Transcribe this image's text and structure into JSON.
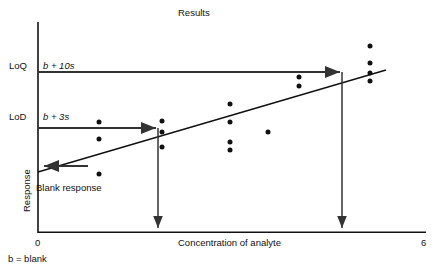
{
  "chart_data": {
    "type": "scatter",
    "title": "Results",
    "xlabel": "Concentration of analyte",
    "ylabel": "Response",
    "xlim": [
      0,
      6
    ],
    "xticklabels": [
      "0",
      "6"
    ],
    "grid": false,
    "legend": null,
    "footnote": "b = blank",
    "annotations": [
      {
        "name": "LoQ",
        "label": "LoQ",
        "formula": "b + 10s",
        "level_y": 72,
        "arrow_to_x": 342
      },
      {
        "name": "LoD",
        "label": "LoD",
        "formula": "b + 3s",
        "level_y": 128,
        "arrow_to_x": 158
      },
      {
        "name": "blank-response",
        "label": "Blank response"
      }
    ],
    "regression_line": {
      "x1": 38,
      "y1": 172,
      "x2": 385,
      "y2": 70
    },
    "points": [
      {
        "x": 99,
        "y": 122
      },
      {
        "x": 99,
        "y": 139
      },
      {
        "x": 99,
        "y": 174
      },
      {
        "x": 162,
        "y": 121
      },
      {
        "x": 162,
        "y": 132
      },
      {
        "x": 162,
        "y": 147
      },
      {
        "x": 230,
        "y": 104
      },
      {
        "x": 230,
        "y": 122
      },
      {
        "x": 230,
        "y": 142
      },
      {
        "x": 230,
        "y": 150
      },
      {
        "x": 268,
        "y": 132
      },
      {
        "x": 299,
        "y": 77
      },
      {
        "x": 299,
        "y": 86
      },
      {
        "x": 370,
        "y": 46
      },
      {
        "x": 370,
        "y": 63
      },
      {
        "x": 370,
        "y": 73
      },
      {
        "x": 370,
        "y": 81
      }
    ]
  },
  "labels": {
    "title": "Results",
    "loq_tick": "LoQ",
    "loq_formula": "b + 10s",
    "lod_tick": "LoD",
    "lod_formula": "b + 3s",
    "blank_response": "Blank response",
    "y_axis": "Response",
    "x_axis": "Concentration of analyte",
    "x_min": "0",
    "x_max": "6",
    "footnote": "b = blank"
  },
  "colors": {
    "ink": "#111111",
    "annotation": "#333333",
    "background": "#ffffff"
  }
}
